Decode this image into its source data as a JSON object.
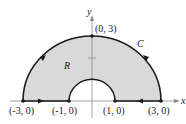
{
  "diagram": {
    "title": "",
    "region_label": "R",
    "curve_label": "C",
    "axes": {
      "x_label": "x",
      "y_label": "y"
    },
    "points": [
      {
        "label": "(-3, 0)",
        "x": -3,
        "y": 0
      },
      {
        "label": "(-1, 0)",
        "x": -1,
        "y": 0
      },
      {
        "label": "(1, 0)",
        "x": 1,
        "y": 0
      },
      {
        "label": "(3, 0)",
        "x": 3,
        "y": 0
      },
      {
        "label": "(0, 3)",
        "x": 0,
        "y": 3
      }
    ],
    "shape": {
      "outer_radius": 3,
      "inner_radius": 1,
      "description": "Upper half annulus between radii 1 and 3, shaded, oriented counterclockwise"
    },
    "colors": {
      "fill": "#d9d9d9",
      "stroke": "#1a1a1a",
      "axis": "#8a8a8a"
    }
  }
}
